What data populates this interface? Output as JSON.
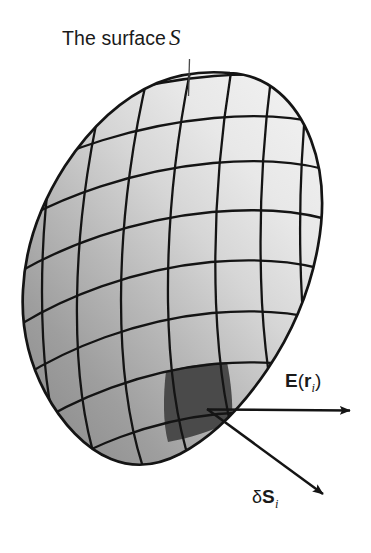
{
  "figure": {
    "background_color": "#ffffff",
    "width": 371,
    "height": 553
  },
  "labels": {
    "surface": {
      "text": "The surface",
      "symbol": "S",
      "full": "The surface S",
      "leader_line": true
    },
    "efield": {
      "vector": "E",
      "open_paren": "(",
      "argument": "r",
      "subscript": "i",
      "close_paren": ")",
      "full": "E(r i)"
    },
    "area_element": {
      "delta": "δ",
      "vector": "S",
      "subscript": "i",
      "full": "δS i"
    }
  },
  "surface": {
    "shape": "ovoid",
    "fill_light": "#ededed",
    "fill_mid": "#c9c9c9",
    "fill_dark": "#9a9a9a",
    "outline_color": "#141414",
    "outline_width": 2.6,
    "grid_color": "#141414",
    "grid_width": 2.3,
    "patch_color": "#4a4a4a",
    "patch_label": "δS i"
  },
  "arrows": {
    "origin": {
      "x": 207,
      "y": 409
    },
    "efield": {
      "name": "E-field arrow",
      "tip": {
        "x": 357,
        "y": 410
      },
      "color": "#141414",
      "width": 2.4
    },
    "area_normal": {
      "name": "area element vector arrow",
      "tip": {
        "x": 330,
        "y": 501
      },
      "color": "#141414",
      "width": 2.4
    }
  },
  "colors": {
    "ink": "#141414",
    "paper": "#ffffff",
    "shade_light": "#ededed",
    "shade_dark": "#9a9a9a",
    "patch": "#4a4a4a"
  }
}
